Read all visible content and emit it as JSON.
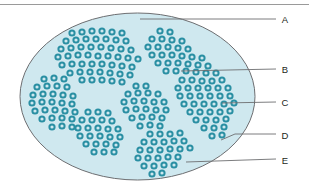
{
  "figure": {
    "name": "histology-diagram",
    "top_rule": {
      "name": "top-divider-rule",
      "color": "#9a9a9a"
    },
    "organ_outline": {
      "name": "organ-outline-ellipse",
      "shape": "ellipse",
      "cx": 137.5,
      "cy": 96.5,
      "rx": 117.5,
      "ry": 83.5,
      "fill": "#cfe8ef",
      "stroke": "#6d6e71"
    },
    "cells": {
      "name": "cell-ring",
      "ring_color": "#2a8fa3",
      "ring_dark": "#1d7f95",
      "lumen_color": "#cfe8ef",
      "radius": 3.6,
      "ring_width": 2.0,
      "count": 196
    },
    "septa": {
      "name": "septum-band",
      "color": "#cfe8ef"
    },
    "leader_lines": {
      "name": "leader-line",
      "color": "#6d6e71"
    }
  },
  "labels": [
    {
      "id": "A",
      "text": "A",
      "x": 285,
      "y": 23,
      "line_from_x": 140,
      "line_from_y": 19,
      "line_to_x": 276,
      "line_to_y": 19,
      "bend": false
    },
    {
      "id": "B",
      "text": "B",
      "x": 285,
      "y": 73,
      "line_from_x": 181,
      "line_from_y": 71,
      "line_to_x": 276,
      "line_to_y": 69,
      "bend": false
    },
    {
      "id": "C",
      "text": "C",
      "x": 285,
      "y": 106,
      "line_from_x": 222,
      "line_from_y": 103,
      "line_to_x": 276,
      "line_to_y": 102,
      "bend": false
    },
    {
      "id": "D",
      "text": "D",
      "x": 285,
      "y": 139,
      "line_from_x": 221,
      "line_from_y": 140,
      "line_to_x": 276,
      "line_to_y": 134,
      "bend": true
    },
    {
      "id": "E",
      "text": "E",
      "x": 285,
      "y": 164,
      "line_from_x": 186,
      "line_from_y": 162,
      "line_to_x": 276,
      "line_to_y": 159,
      "bend": false
    }
  ],
  "chart_data": {
    "type": "scatter",
    "xlabel": "",
    "ylabel": "",
    "legend": [
      "A",
      "B",
      "C",
      "D",
      "E"
    ],
    "annotations": [
      "A",
      "B",
      "C",
      "D",
      "E"
    ],
    "lobules": [
      {
        "name": "lobule-upper-left",
        "cells": [
          [
            72,
            33
          ],
          [
            82,
            32
          ],
          [
            92,
            31
          ],
          [
            102,
            31
          ],
          [
            112,
            32
          ],
          [
            122,
            33
          ],
          [
            66,
            41
          ],
          [
            76,
            40
          ],
          [
            86,
            39
          ],
          [
            96,
            39
          ],
          [
            106,
            39
          ],
          [
            116,
            40
          ],
          [
            126,
            41
          ],
          [
            61,
            49
          ],
          [
            71,
            48
          ],
          [
            81,
            47
          ],
          [
            91,
            47
          ],
          [
            101,
            47
          ],
          [
            111,
            48
          ],
          [
            121,
            49
          ],
          [
            131,
            50
          ],
          [
            58,
            57
          ],
          [
            68,
            56
          ],
          [
            78,
            55
          ],
          [
            88,
            55
          ],
          [
            98,
            56
          ],
          [
            108,
            56
          ],
          [
            118,
            57
          ],
          [
            128,
            58
          ],
          [
            138,
            59
          ],
          [
            62,
            65
          ],
          [
            72,
            64
          ],
          [
            82,
            64
          ],
          [
            92,
            64
          ],
          [
            102,
            64
          ],
          [
            112,
            65
          ],
          [
            122,
            66
          ],
          [
            132,
            67
          ],
          [
            70,
            73
          ],
          [
            80,
            72
          ],
          [
            90,
            72
          ],
          [
            100,
            72
          ],
          [
            110,
            73
          ],
          [
            120,
            74
          ],
          [
            130,
            75
          ],
          [
            82,
            80
          ],
          [
            92,
            80
          ],
          [
            102,
            80
          ],
          [
            112,
            81
          ],
          [
            122,
            82
          ]
        ]
      },
      {
        "name": "lobule-upper-right",
        "cells": [
          [
            160,
            31
          ],
          [
            170,
            32
          ],
          [
            152,
            39
          ],
          [
            162,
            39
          ],
          [
            172,
            40
          ],
          [
            182,
            41
          ],
          [
            148,
            47
          ],
          [
            158,
            47
          ],
          [
            168,
            47
          ],
          [
            178,
            48
          ],
          [
            188,
            49
          ],
          [
            152,
            55
          ],
          [
            162,
            55
          ],
          [
            172,
            55
          ],
          [
            182,
            56
          ],
          [
            192,
            57
          ],
          [
            202,
            58
          ],
          [
            158,
            63
          ],
          [
            168,
            63
          ],
          [
            178,
            63
          ],
          [
            188,
            64
          ],
          [
            198,
            65
          ],
          [
            208,
            66
          ],
          [
            166,
            71
          ],
          [
            176,
            71
          ],
          [
            186,
            71
          ],
          [
            196,
            72
          ],
          [
            206,
            73
          ],
          [
            216,
            73
          ]
        ]
      },
      {
        "name": "lobule-left",
        "cells": [
          [
            44,
            79
          ],
          [
            54,
            78
          ],
          [
            64,
            79
          ],
          [
            37,
            87
          ],
          [
            47,
            86
          ],
          [
            57,
            86
          ],
          [
            67,
            87
          ],
          [
            33,
            95
          ],
          [
            43,
            94
          ],
          [
            53,
            94
          ],
          [
            63,
            95
          ],
          [
            73,
            96
          ],
          [
            32,
            103
          ],
          [
            42,
            102
          ],
          [
            52,
            102
          ],
          [
            62,
            103
          ],
          [
            72,
            104
          ],
          [
            35,
            111
          ],
          [
            45,
            110
          ],
          [
            55,
            110
          ],
          [
            65,
            111
          ],
          [
            75,
            112
          ],
          [
            42,
            119
          ],
          [
            52,
            118
          ],
          [
            62,
            118
          ],
          [
            72,
            119
          ],
          [
            52,
            127
          ],
          [
            62,
            126
          ],
          [
            72,
            127
          ]
        ]
      },
      {
        "name": "lobule-center",
        "cells": [
          [
            136,
            86
          ],
          [
            146,
            86
          ],
          [
            128,
            94
          ],
          [
            138,
            93
          ],
          [
            148,
            93
          ],
          [
            158,
            94
          ],
          [
            124,
            102
          ],
          [
            134,
            101
          ],
          [
            144,
            101
          ],
          [
            154,
            102
          ],
          [
            164,
            102
          ],
          [
            126,
            110
          ],
          [
            136,
            109
          ],
          [
            146,
            109
          ],
          [
            156,
            110
          ],
          [
            166,
            110
          ],
          [
            132,
            118
          ],
          [
            142,
            117
          ],
          [
            152,
            117
          ],
          [
            162,
            118
          ],
          [
            140,
            126
          ],
          [
            150,
            125
          ],
          [
            160,
            126
          ]
        ]
      },
      {
        "name": "lobule-right",
        "cells": [
          [
            182,
            80
          ],
          [
            192,
            80
          ],
          [
            202,
            81
          ],
          [
            212,
            81
          ],
          [
            222,
            80
          ],
          [
            178,
            88
          ],
          [
            188,
            88
          ],
          [
            198,
            88
          ],
          [
            208,
            88
          ],
          [
            218,
            88
          ],
          [
            228,
            88
          ],
          [
            180,
            96
          ],
          [
            190,
            96
          ],
          [
            200,
            96
          ],
          [
            210,
            96
          ],
          [
            220,
            96
          ],
          [
            230,
            96
          ],
          [
            184,
            104
          ],
          [
            194,
            104
          ],
          [
            204,
            104
          ],
          [
            214,
            104
          ],
          [
            224,
            104
          ],
          [
            234,
            103
          ],
          [
            190,
            112
          ],
          [
            200,
            112
          ],
          [
            210,
            112
          ],
          [
            220,
            112
          ],
          [
            230,
            111
          ],
          [
            196,
            120
          ],
          [
            206,
            120
          ],
          [
            216,
            120
          ],
          [
            226,
            119
          ],
          [
            204,
            128
          ],
          [
            214,
            128
          ],
          [
            224,
            127
          ],
          [
            212,
            136
          ],
          [
            222,
            135
          ]
        ]
      },
      {
        "name": "lobule-lower-left",
        "cells": [
          [
            88,
            112
          ],
          [
            98,
            112
          ],
          [
            108,
            113
          ],
          [
            82,
            120
          ],
          [
            92,
            120
          ],
          [
            102,
            120
          ],
          [
            112,
            121
          ],
          [
            78,
            128
          ],
          [
            88,
            128
          ],
          [
            98,
            128
          ],
          [
            108,
            129
          ],
          [
            118,
            129
          ],
          [
            80,
            136
          ],
          [
            90,
            136
          ],
          [
            100,
            136
          ],
          [
            110,
            137
          ],
          [
            120,
            137
          ],
          [
            86,
            144
          ],
          [
            96,
            144
          ],
          [
            106,
            144
          ],
          [
            116,
            145
          ],
          [
            94,
            152
          ],
          [
            104,
            152
          ],
          [
            114,
            152
          ]
        ]
      },
      {
        "name": "lobule-lower-right",
        "cells": [
          [
            150,
            134
          ],
          [
            160,
            134
          ],
          [
            170,
            134
          ],
          [
            180,
            133
          ],
          [
            144,
            142
          ],
          [
            154,
            142
          ],
          [
            164,
            142
          ],
          [
            174,
            141
          ],
          [
            184,
            141
          ],
          [
            140,
            150
          ],
          [
            150,
            150
          ],
          [
            160,
            150
          ],
          [
            170,
            149
          ],
          [
            180,
            149
          ],
          [
            190,
            148
          ],
          [
            138,
            158
          ],
          [
            148,
            158
          ],
          [
            158,
            158
          ],
          [
            168,
            157
          ],
          [
            178,
            157
          ],
          [
            144,
            166
          ],
          [
            154,
            166
          ],
          [
            164,
            165
          ],
          [
            174,
            165
          ],
          [
            152,
            174
          ],
          [
            162,
            173
          ]
        ]
      }
    ]
  }
}
